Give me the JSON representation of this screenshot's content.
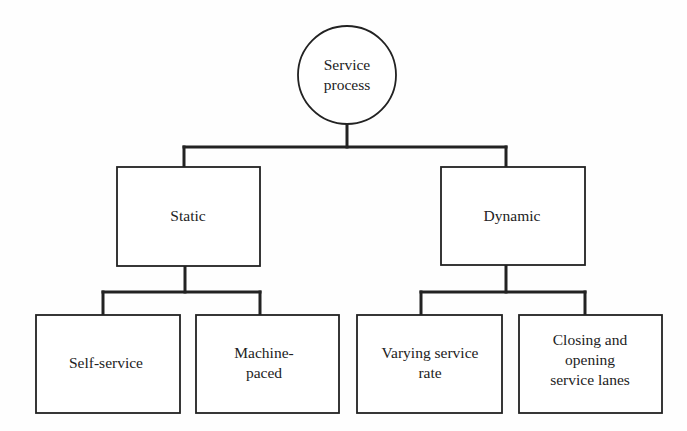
{
  "diagram": {
    "type": "hierarchy",
    "colors": {
      "stroke": "#222222",
      "text": "#222222",
      "background": "#fefefe"
    },
    "root": {
      "id": "service-process",
      "shape": "circle",
      "lines": [
        "Service",
        "process"
      ]
    },
    "level1": [
      {
        "id": "static",
        "shape": "rect",
        "lines": [
          "Static"
        ]
      },
      {
        "id": "dynamic",
        "shape": "rect",
        "lines": [
          "Dynamic"
        ]
      }
    ],
    "level2": [
      {
        "id": "self-service",
        "parent": "static",
        "lines": [
          "Self-service"
        ]
      },
      {
        "id": "machine-paced",
        "parent": "static",
        "lines": [
          "Machine-",
          "paced"
        ]
      },
      {
        "id": "varying-service-rate",
        "parent": "dynamic",
        "lines": [
          "Varying service",
          "rate"
        ]
      },
      {
        "id": "closing-opening-lanes",
        "parent": "dynamic",
        "lines": [
          "Closing and",
          "opening",
          "service lanes"
        ]
      }
    ]
  }
}
